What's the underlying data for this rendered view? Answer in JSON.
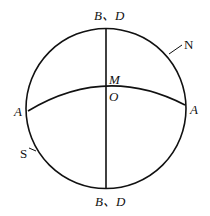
{
  "diagram": {
    "labels": {
      "top": "B、D",
      "bottom": "B、D",
      "center_upper": "M",
      "center_lower": "O",
      "left": "A",
      "right": "A",
      "north_marker": "N",
      "south_marker": "S"
    },
    "colors": {
      "stroke": "#111111",
      "background": "#ffffff"
    }
  }
}
